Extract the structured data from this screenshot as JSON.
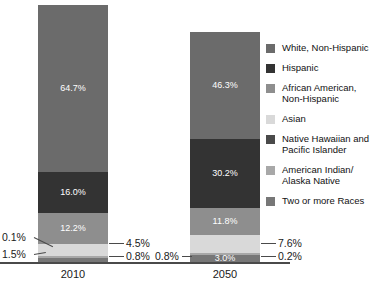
{
  "chart_data": {
    "type": "bar",
    "subtype": "stacked-bar-100-percent",
    "title": "",
    "subtitle": "",
    "xlabel": "",
    "ylabel": "",
    "ylim": [
      0,
      100
    ],
    "grid": false,
    "legend_position": "right",
    "categories": [
      "2010",
      "2050"
    ],
    "series": [
      {
        "name": "White, Non-Hispanic",
        "color": "#6b6b6b",
        "values": [
          64.7,
          46.3
        ]
      },
      {
        "name": "Hispanic",
        "color": "#333333",
        "values": [
          16.0,
          30.2
        ]
      },
      {
        "name": "African American,\nNon-Hispanic",
        "color": "#8e8e8e",
        "values": [
          12.2,
          11.8
        ]
      },
      {
        "name": "Asian",
        "color": "#d9d9d9",
        "values": [
          4.5,
          7.6
        ]
      },
      {
        "name": "Native Hawaiian and\nPacific Islander",
        "color": "#4a4a4a",
        "values": [
          0.1,
          0.2
        ]
      },
      {
        "name": "American Indian/\nAlaska Native",
        "color": "#a8a8a8",
        "values": [
          0.8,
          0.8
        ]
      },
      {
        "name": "Two or more Races",
        "color": "#777777",
        "values": [
          1.5,
          3.0
        ]
      }
    ]
  },
  "bars": {
    "b2010": {
      "caption": "2010",
      "segments": [
        {
          "key": "white",
          "label": "64.7%",
          "inside": true
        },
        {
          "key": "hispanic",
          "label": "16.0%",
          "inside": true
        },
        {
          "key": "african",
          "label": "12.2%",
          "inside": true
        },
        {
          "key": "asian",
          "label": "4.5%",
          "inside": false
        },
        {
          "key": "nhpi",
          "label": "0.1%",
          "inside": false
        },
        {
          "key": "aian",
          "label": "0.8%",
          "inside": false
        },
        {
          "key": "twoplus",
          "label": "1.5%",
          "inside": false
        }
      ]
    },
    "b2050": {
      "caption": "2050",
      "segments": [
        {
          "key": "white",
          "label": "46.3%",
          "inside": true
        },
        {
          "key": "hispanic",
          "label": "30.2%",
          "inside": true
        },
        {
          "key": "african",
          "label": "11.8%",
          "inside": true
        },
        {
          "key": "asian",
          "label": "7.6%",
          "inside": false
        },
        {
          "key": "nhpi",
          "label": "0.2%",
          "inside": false
        },
        {
          "key": "aian",
          "label": "0.8%",
          "inside": false
        },
        {
          "key": "twoplus",
          "label": "3.0%",
          "inside": true
        }
      ]
    }
  },
  "callouts": {
    "c2010_nhpi": "0.1%",
    "c2010_twoplus": "1.5%",
    "c2010_asian": "4.5%",
    "c2010_aian": "0.8%",
    "c2050_aian": "0.8%",
    "c2050_asian": "7.6%",
    "c2050_nhpi": "0.2%"
  },
  "legend": {
    "items": [
      {
        "label": "White, Non-Hispanic",
        "color": "#6b6b6b"
      },
      {
        "label": "Hispanic",
        "color": "#333333"
      },
      {
        "label": "African American,\nNon-Hispanic",
        "color": "#8e8e8e"
      },
      {
        "label": "Asian",
        "color": "#d9d9d9"
      },
      {
        "label": "Native Hawaiian and\nPacific Islander",
        "color": "#4a4a4a"
      },
      {
        "label": "American Indian/\nAlaska Native",
        "color": "#a8a8a8"
      },
      {
        "label": "Two or more Races",
        "color": "#777777"
      }
    ]
  }
}
